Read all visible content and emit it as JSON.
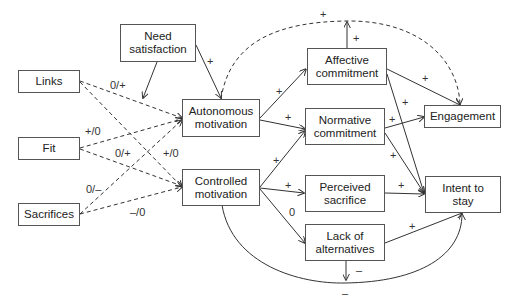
{
  "diagram": {
    "type": "path-model",
    "nodes": {
      "need_satisfaction": "Need satisfaction",
      "links": "Links",
      "fit": "Fit",
      "sacrifices": "Sacrifices",
      "autonomous_motivation": "Autonomous motivation",
      "controlled_motivation": "Controlled motivation",
      "affective_commitment": "Affective commitment",
      "normative_commitment": "Normative commitment",
      "perceived_sacrifice": "Perceived sacrifice",
      "lack_of_alternatives": "Lack of alternatives",
      "engagement": "Engagement",
      "intent_to_stay": "Intent to stay"
    },
    "node_lines": {
      "need_satisfaction": [
        "Need",
        "satisfaction"
      ],
      "autonomous_motivation": [
        "Autonomous",
        "motivation"
      ],
      "controlled_motivation": [
        "Controlled",
        "motivation"
      ],
      "affective_commitment": [
        "Affective",
        "commitment"
      ],
      "normative_commitment": [
        "Normative",
        "commitment"
      ],
      "perceived_sacrifice": [
        "Perceived",
        "sacrifice"
      ],
      "lack_of_alternatives": [
        "Lack of",
        "alternatives"
      ],
      "intent_to_stay": [
        "Intent to",
        "stay"
      ]
    },
    "edges": [
      {
        "from": "Need satisfaction",
        "to": "Autonomous motivation",
        "label": "+",
        "style": "solid"
      },
      {
        "from": "Need satisfaction",
        "to": "Links→Autonomous path (moderation)",
        "label": "",
        "style": "solid"
      },
      {
        "from": "Links",
        "to": "Autonomous motivation",
        "label": "0/+",
        "style": "dashed"
      },
      {
        "from": "Links",
        "to": "Controlled motivation",
        "label": "+/0",
        "style": "dashed"
      },
      {
        "from": "Fit",
        "to": "Autonomous motivation",
        "label": "+/0",
        "style": "dashed"
      },
      {
        "from": "Fit",
        "to": "Controlled motivation",
        "label": "0/+",
        "style": "dashed"
      },
      {
        "from": "Sacrifices",
        "to": "Autonomous motivation",
        "label": "0/–",
        "style": "dashed"
      },
      {
        "from": "Sacrifices",
        "to": "Controlled motivation",
        "label": "–/0",
        "style": "dashed"
      },
      {
        "from": "Autonomous motivation",
        "to": "Affective commitment",
        "label": "+",
        "style": "solid"
      },
      {
        "from": "Autonomous motivation",
        "to": "Normative commitment",
        "label": "+",
        "style": "solid"
      },
      {
        "from": "Autonomous motivation",
        "to": "Engagement",
        "label": "+",
        "style": "dashed-curve"
      },
      {
        "from": "Controlled motivation",
        "to": "Normative commitment",
        "label": "+",
        "style": "solid"
      },
      {
        "from": "Controlled motivation",
        "to": "Perceived sacrifice",
        "label": "+",
        "style": "solid"
      },
      {
        "from": "Controlled motivation",
        "to": "Lack of alternatives",
        "label": "0",
        "style": "solid"
      },
      {
        "from": "Controlled motivation",
        "to": "Intent to stay",
        "label": "–",
        "style": "solid-curve"
      },
      {
        "from": "Affective commitment",
        "to": "(upward)",
        "label": "+",
        "style": "solid"
      },
      {
        "from": "Affective commitment",
        "to": "Engagement",
        "label": "+",
        "style": "solid"
      },
      {
        "from": "Affective commitment",
        "to": "Intent to stay",
        "label": "+",
        "style": "solid"
      },
      {
        "from": "Normative commitment",
        "to": "Engagement",
        "label": "+",
        "style": "solid"
      },
      {
        "from": "Normative commitment",
        "to": "Intent to stay",
        "label": "+",
        "style": "solid"
      },
      {
        "from": "Perceived sacrifice",
        "to": "Intent to stay",
        "label": "+",
        "style": "solid"
      },
      {
        "from": "Lack of alternatives",
        "to": "Intent to stay",
        "label": "+",
        "style": "solid"
      },
      {
        "from": "Lack of alternatives",
        "to": "(downward)",
        "label": "–",
        "style": "solid"
      }
    ],
    "labels": {
      "ns_auto": "+",
      "links_auto": "0/+",
      "fit_auto": "+/0",
      "fit_ctrl": "0/+",
      "links_ctrl": "+/0",
      "sac_auto": "0/–",
      "sac_ctrl": "–/0",
      "auto_aff": "+",
      "auto_norm": "+",
      "ctrl_norm": "+",
      "ctrl_perc": "+",
      "ctrl_lack": "0",
      "aff_up": "+",
      "arc_top": "+",
      "aff_eng": "+",
      "aff_int": "+",
      "norm_eng": "+",
      "norm_int": "+",
      "perc_int": "+",
      "lack_int": "+",
      "lack_down": "–",
      "arc_bottom": "–"
    }
  }
}
